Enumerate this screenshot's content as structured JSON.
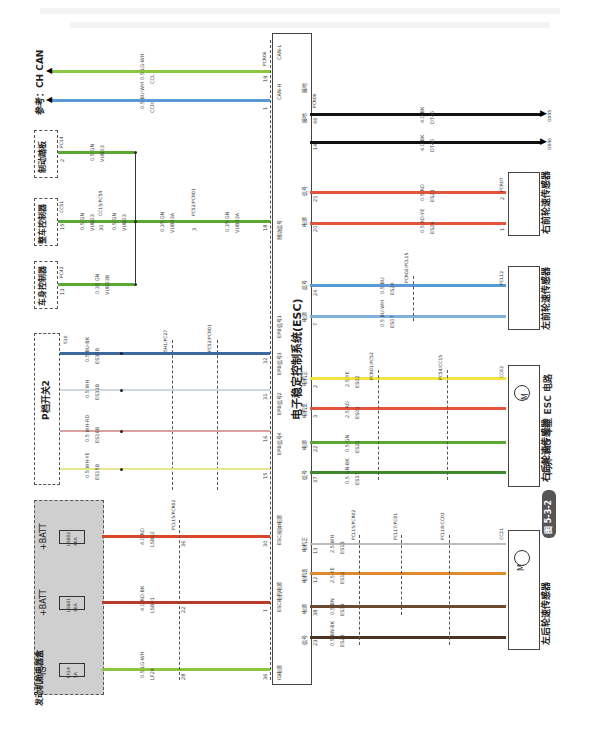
{
  "figure": {
    "number": "图 5-3-2",
    "caption": "问界 M5 车型 ESC 电路"
  },
  "reference": {
    "label": "参考：CH CAN"
  },
  "modules": {
    "esc": {
      "title": "电子稳定控制系统(ESC)"
    },
    "engine_fuse_box": {
      "title": "发动机舱电器盒",
      "fuses": [
        {
          "supply": "IG",
          "name": "LF24",
          "rating": "5A"
        },
        {
          "supply": "+BATT",
          "name": "LSB01",
          "rating": "40A"
        },
        {
          "supply": "+BATT",
          "name": "LSB02",
          "rating": "40A"
        }
      ]
    },
    "p_switch": {
      "title": "P档开关2"
    },
    "body_controller": {
      "title": "车身控制器",
      "conn": "PC42",
      "pin": "13"
    },
    "vehicle_controller": {
      "title": "整车控制器",
      "conn": "CC51",
      "pin": "15"
    },
    "brake_pedal": {
      "title": "制动踏板",
      "conn": "PC14",
      "pin": "2"
    },
    "lr_wheel_sensor": {
      "title": "左后轮速传感器",
      "conn": "CC21",
      "motor_label": "M"
    },
    "rr_wheel_sensor": {
      "title": "右后轮速传感器",
      "conn": "CC62",
      "motor_label": "M"
    },
    "lf_wheel_sensor": {
      "title": "左前轮速传感器",
      "conn": "PCL12"
    },
    "rf_wheel_sensor": {
      "title": "右前轮速传感器",
      "conn": "PCR07"
    }
  },
  "esc_pins": {
    "can_h": {
      "label": "CAN-H",
      "pin": "1"
    },
    "can_l": {
      "label": "CAN-L",
      "pin": "19",
      "conn": "PCR06"
    },
    "brake_signal": {
      "label": "制动信号",
      "pin": "18"
    },
    "epb1": {
      "label": "EPB信号1",
      "pin": "32"
    },
    "epb3": {
      "label": "EPB信号3",
      "pin": "31"
    },
    "epb2": {
      "label": "EPB信号2",
      "pin": "16"
    },
    "epb4": {
      "label": "EPB信号4",
      "pin": "15"
    },
    "valve_power": {
      "label": "ESC阀体电源",
      "pin": "30"
    },
    "motor_power": {
      "label": "ESC电机电源",
      "pin": "1"
    },
    "ig_power": {
      "label": "IG电源",
      "pin": "36"
    },
    "lr_sig": {
      "label": "信号",
      "pin": "23"
    },
    "lr_pwr": {
      "label": "电源",
      "pin": "38"
    },
    "lr_mneg": {
      "label": "电机负",
      "pin": "12"
    },
    "lr_mpos": {
      "label": "电机正",
      "pin": "13"
    },
    "rr_sig": {
      "label": "信号",
      "pin": "37"
    },
    "rr_pwr": {
      "label": "电源",
      "pin": "22"
    },
    "rr_mneg": {
      "label": "电机负",
      "pin": "3"
    },
    "rr_mpos": {
      "label": "电机正",
      "pin": "2"
    },
    "lf_pwr": {
      "label": "电源",
      "pin": "7"
    },
    "lf_sig": {
      "label": "信号",
      "pin": "24"
    },
    "rf_pwr": {
      "label": "电源",
      "pin": "20"
    },
    "rf_sig": {
      "label": "信号",
      "pin": "21"
    },
    "gnd1": {
      "label": "接地",
      "pin": "14"
    },
    "gnd2": {
      "label": "接地",
      "pin": "46",
      "conn": "PCR06"
    }
  },
  "wires": {
    "can_l": {
      "spec": "0.5 LG-WH",
      "circuit": "CCL",
      "color": "#8dc63f"
    },
    "can_h": {
      "spec": "0.5 BU-WH",
      "circuit": "CCH",
      "color": "#5b9bd5"
    },
    "brake_pedal": {
      "spec": "0.5 GN",
      "circuit": "VUB03",
      "color": "#5aa832"
    },
    "vcu_a": {
      "spec": "0.5 GN",
      "circuit": "VUB03",
      "color": "#5aa832"
    },
    "vcu_b": {
      "spec": "0.5 GN",
      "circuit": "VUB03",
      "color": "#5aa832"
    },
    "vcu_c": {
      "spec": "0.35 GN",
      "circuit": "VUB03A",
      "color": "#5aa832"
    },
    "vcu_d": {
      "spec": "0.35 GN",
      "circuit": "VUB03A",
      "color": "#5aa832"
    },
    "body": {
      "spec": "0.35 GN",
      "circuit": "VUB03B",
      "color": "#5aa832"
    },
    "epb1": {
      "spec": "0.5 BU-BK",
      "circuits": [
        "ES32B",
        "ES32",
        "ES32",
        "ES32"
      ],
      "color": "#3d6a9e"
    },
    "epb3": {
      "spec": "0.5 WH",
      "circuits": [
        "ES31B",
        "ES31",
        "ES31",
        "ES31"
      ],
      "color": "#cfd8dc"
    },
    "epb2": {
      "spec": "0.5 WH-RD",
      "circuits": [
        "ES16B",
        "ES16",
        "ES16",
        "ES16"
      ],
      "color": "#d8a0a0"
    },
    "epb4": {
      "spec": "0.5 WH-YE",
      "circuits": [
        "ES15B",
        "ES15",
        "ES15",
        "ES15"
      ],
      "color": "#e6e88a"
    },
    "valve": {
      "spec": "4.0 RD",
      "circuit": "LSB02",
      "color": "#d9472b"
    },
    "motor": {
      "spec": "4.0 RD-BK",
      "circuit": "LSB01",
      "color": "#b83a28"
    },
    "ig": {
      "spec": "0.5 LG-WH",
      "circuit": "LF24",
      "color": "#8dc63f"
    },
    "lr_mpos": {
      "specs": [
        "2.5 WH",
        "2.5 WH",
        "2.5 WH",
        "2.5 WH"
      ],
      "circuit": "ES13",
      "color": "#bbbbbb"
    },
    "lr_mneg": {
      "specs": [
        "2.5 YE",
        "2.5 OG",
        "2.5 OG",
        "2.5 OG"
      ],
      "circuit": "ES12",
      "color": "#e08a2c"
    },
    "lr_pwr": {
      "spec": "0.5 BN",
      "circuit": "ES39",
      "color": "#6b4a2f"
    },
    "lr_sig": {
      "spec": "0.5 BN-BK",
      "circuit": "ES23",
      "color": "#4a3320"
    },
    "rr_mpos": {
      "spec": "2.5 YE",
      "circuit": "ES02",
      "color": "#f2e341"
    },
    "rr_mneg": {
      "spec": "2.5 RD",
      "circuit": "ES03",
      "color": "#e2553a"
    },
    "rr_pwr": {
      "spec": "0.5 GN",
      "circuit": "ES22",
      "color": "#5aa832"
    },
    "rr_sig": {
      "spec": "0.5 GN-BK",
      "circuit": "ES37",
      "color": "#3f8a2a"
    },
    "lf_pwr": {
      "spec": "0.5 BU-WH",
      "circuit": "ES07",
      "color": "#7fb0de"
    },
    "lf_sig": {
      "spec": "0.5 BU",
      "circuit": "ES24",
      "color": "#5b9bd5"
    },
    "rf_pwr": {
      "spec": "0.5 RD-YE",
      "circuit": "ES26",
      "color": "#e2553a"
    },
    "rf_sig": {
      "spec": "0.5 RD",
      "circuit": "ES21",
      "color": "#e2553a"
    },
    "gnd1": {
      "spec": "4.0 BK",
      "circuit": "DT46",
      "ground": "G046",
      "color": "#111111"
    },
    "gnd2": {
      "spec": "4.0 BK",
      "circuit": "DT45",
      "ground": "G045",
      "color": "#111111"
    }
  },
  "inline_connectors": {
    "vcu_mid": {
      "name": "CC15/PC54",
      "pin": "30"
    },
    "vcu_pc": {
      "name": "PC52/PCR01",
      "pin": "3"
    },
    "epb_a": {
      "name": "S16"
    },
    "epb_b": {
      "name": "SH1/PC27"
    },
    "epb_c": {
      "name": "PC52/PCR01"
    },
    "pwr": {
      "name": "PCL15/PCR02",
      "pins": [
        "28",
        "22",
        "36"
      ]
    },
    "lr_a": {
      "name": "PCL15/PCR02",
      "pins": [
        "9",
        "10",
        "20",
        "1"
      ]
    },
    "lr_b": {
      "name": "PCL17/PC01",
      "pins": [
        "3",
        "4"
      ]
    },
    "lr_c": {
      "name": "PCL18/CC03",
      "pins": [
        "12",
        "13",
        "13",
        "12"
      ]
    },
    "rr_a": {
      "name": "PCR01/PC52",
      "pins": [
        "21",
        "12",
        "1",
        "19"
      ]
    },
    "rr_b": {
      "name": "PC54/CC15",
      "pins": [
        "20",
        "19",
        "11",
        "10"
      ]
    },
    "lf_a": {
      "name": "PCR02/PCL15",
      "pins": [
        "2",
        "3"
      ]
    }
  },
  "sensor_pins": {
    "lr": [
      "1",
      "2",
      "3",
      "4"
    ],
    "rr": [
      "1",
      "2",
      "3",
      "4"
    ],
    "lf": [
      "1",
      "2"
    ],
    "rf": [
      "1",
      "2"
    ]
  }
}
